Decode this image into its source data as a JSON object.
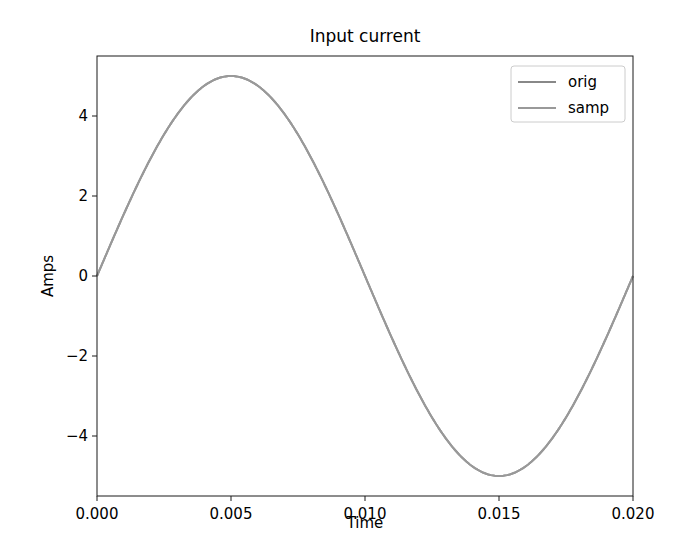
{
  "chart_data": {
    "type": "line",
    "title": "Input current",
    "xlabel": "Time",
    "ylabel": "Amps",
    "xlim": [
      0.0,
      0.02
    ],
    "ylim": [
      -5.5,
      5.5
    ],
    "xticks": [
      0.0,
      0.005,
      0.01,
      0.015,
      0.02
    ],
    "xtick_labels": [
      "0.000",
      "0.005",
      "0.010",
      "0.015",
      "0.020"
    ],
    "yticks": [
      -4,
      -2,
      0,
      2,
      4
    ],
    "ytick_labels": [
      "−4",
      "−2",
      "0",
      "2",
      "4"
    ],
    "grid": false,
    "legend_position": "upper right",
    "series": [
      {
        "name": "orig",
        "color": "#888888",
        "function": "5*sin(2*pi*50*t)",
        "amplitude": 5,
        "frequency_hz": 50,
        "x": [
          0.0,
          0.0025,
          0.005,
          0.0075,
          0.01,
          0.0125,
          0.015,
          0.0175,
          0.02
        ],
        "y": [
          0.0,
          3.54,
          5.0,
          3.54,
          0.0,
          -3.54,
          -5.0,
          -3.54,
          0.0
        ]
      },
      {
        "name": "samp",
        "color": "#999999",
        "function": "5*sin(2*pi*50*t)",
        "amplitude": 5,
        "frequency_hz": 50,
        "x": [
          0.0,
          0.0025,
          0.005,
          0.0075,
          0.01,
          0.0125,
          0.015,
          0.0175,
          0.02
        ],
        "y": [
          0.0,
          3.54,
          5.0,
          3.54,
          0.0,
          -3.54,
          -5.0,
          -3.54,
          0.0
        ]
      }
    ]
  }
}
